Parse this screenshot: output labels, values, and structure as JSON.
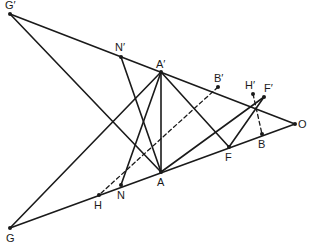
{
  "figure": {
    "type": "geometric construction",
    "points": [
      {
        "id": "Gp",
        "label": "G′",
        "x": 10,
        "y": 14,
        "lx": 5,
        "ly": 9
      },
      {
        "id": "G",
        "label": "G",
        "x": 10,
        "y": 228,
        "lx": 6,
        "ly": 242
      },
      {
        "id": "O",
        "label": "O",
        "x": 295,
        "y": 124,
        "lx": 298,
        "ly": 128
      },
      {
        "id": "Ap",
        "label": "A′",
        "x": 161,
        "y": 72,
        "lx": 156,
        "ly": 68
      },
      {
        "id": "A",
        "label": "A",
        "x": 161,
        "y": 172,
        "lx": 157,
        "ly": 186
      },
      {
        "id": "Np",
        "label": "N′",
        "x": 121,
        "y": 57,
        "lx": 115,
        "ly": 51
      },
      {
        "id": "N",
        "label": "N",
        "x": 121,
        "y": 185,
        "lx": 117,
        "ly": 199
      },
      {
        "id": "Bp",
        "label": "B′",
        "x": 218,
        "y": 87,
        "lx": 214,
        "ly": 82
      },
      {
        "id": "B",
        "label": "B",
        "x": 262,
        "y": 134,
        "lx": 258,
        "ly": 148
      },
      {
        "id": "Hp",
        "label": "H′",
        "x": 253,
        "y": 94,
        "lx": 245,
        "ly": 89
      },
      {
        "id": "H",
        "label": "H",
        "x": 99,
        "y": 195,
        "lx": 94,
        "ly": 209
      },
      {
        "id": "Fp",
        "label": "F′",
        "x": 264,
        "y": 97,
        "lx": 264,
        "ly": 92
      },
      {
        "id": "F",
        "label": "F",
        "x": 229,
        "y": 147,
        "lx": 225,
        "ly": 161
      }
    ],
    "segments": [
      {
        "from": "Gp",
        "to": "O",
        "style": "solid"
      },
      {
        "from": "G",
        "to": "O",
        "style": "solid"
      },
      {
        "from": "Gp",
        "to": "A",
        "style": "solid"
      },
      {
        "from": "G",
        "to": "Ap",
        "style": "solid"
      },
      {
        "from": "Ap",
        "to": "A",
        "style": "solid"
      },
      {
        "from": "Np",
        "to": "A",
        "style": "solid"
      },
      {
        "from": "N",
        "to": "Ap",
        "style": "solid"
      },
      {
        "from": "Ap",
        "to": "F",
        "style": "solid"
      },
      {
        "from": "A",
        "to": "Fp",
        "style": "solid"
      },
      {
        "from": "Fp",
        "to": "F",
        "style": "solid"
      },
      {
        "from": "Bp",
        "to": "H",
        "style": "dashed"
      },
      {
        "from": "Hp",
        "to": "B",
        "style": "dashed"
      }
    ]
  }
}
